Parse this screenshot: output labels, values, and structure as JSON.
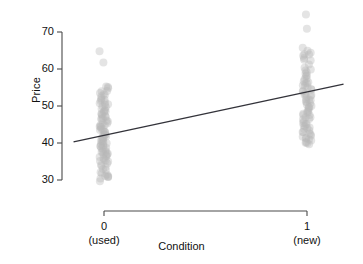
{
  "chart_data": {
    "type": "scatter",
    "title": "",
    "xlabel": "Condition",
    "ylabel": "Price",
    "xlim": [
      -0.18,
      1.18
    ],
    "ylim": [
      27,
      76
    ],
    "grid": false,
    "legend": null,
    "x_ticks": [
      {
        "value": 0,
        "label": "0",
        "sublabel": "(used)"
      },
      {
        "value": 1,
        "label": "1",
        "sublabel": "(new)"
      }
    ],
    "y_ticks": [
      30,
      40,
      50,
      60,
      70
    ],
    "point_style": {
      "color": "#b9b9b9",
      "opacity": 0.38,
      "radius": 4.0,
      "jitter_x": 0.022
    },
    "line_style": {
      "color": "#33333a",
      "width": 1.4
    },
    "fit_line": {
      "x": [
        -0.15,
        1.18
      ],
      "y": [
        40.3,
        55.9
      ],
      "intercept": 42.0,
      "slope": 13.7
    },
    "series": [
      {
        "name": "used",
        "x_value": 0,
        "values": [
          64.9,
          61.6,
          55.2,
          55.0,
          54.6,
          54.2,
          53.9,
          53.6,
          53.2,
          52.9,
          52.5,
          52.2,
          51.9,
          51.6,
          51.3,
          51.0,
          50.7,
          50.4,
          50.1,
          49.9,
          49.6,
          49.3,
          49.0,
          48.8,
          48.5,
          48.2,
          48.0,
          47.7,
          47.5,
          47.2,
          47.0,
          46.7,
          46.5,
          46.2,
          46.0,
          45.8,
          45.5,
          45.3,
          45.0,
          44.8,
          44.6,
          44.3,
          44.1,
          43.9,
          43.6,
          43.4,
          43.2,
          43.0,
          42.7,
          42.5,
          42.3,
          42.1,
          41.9,
          41.6,
          41.4,
          41.2,
          41.0,
          40.8,
          40.6,
          40.4,
          40.1,
          39.9,
          39.7,
          39.5,
          39.3,
          39.1,
          38.9,
          38.7,
          38.5,
          38.3,
          38.0,
          37.8,
          37.6,
          37.4,
          37.2,
          37.0,
          36.8,
          36.6,
          36.4,
          36.1,
          35.9,
          35.7,
          35.4,
          35.2,
          34.9,
          34.6,
          34.3,
          33.9,
          33.5,
          33.1,
          32.6,
          32.2,
          31.8,
          31.5,
          31.2,
          31.0,
          30.8,
          30.6,
          30.3,
          29.6
        ]
      },
      {
        "name": "new",
        "x_value": 1,
        "values": [
          74.8,
          70.9,
          65.8,
          65.0,
          64.5,
          64.1,
          63.8,
          63.4,
          63.1,
          62.7,
          62.2,
          61.2,
          60.5,
          60.0,
          59.6,
          59.2,
          58.8,
          58.4,
          58.0,
          57.6,
          57.2,
          56.9,
          56.5,
          56.2,
          55.9,
          55.6,
          55.3,
          55.0,
          54.7,
          54.4,
          54.1,
          53.8,
          53.5,
          53.2,
          52.9,
          52.6,
          52.3,
          52.0,
          51.8,
          51.5,
          51.2,
          50.9,
          50.6,
          50.3,
          50.0,
          49.7,
          49.4,
          49.1,
          48.8,
          48.5,
          48.2,
          47.9,
          47.6,
          47.4,
          47.1,
          46.8,
          46.5,
          46.2,
          45.9,
          45.6,
          45.3,
          45.0,
          44.8,
          44.5,
          44.2,
          43.9,
          43.7,
          43.4,
          43.1,
          42.9,
          42.6,
          42.3,
          42.0,
          41.7,
          41.5,
          41.2,
          41.0,
          40.8,
          40.5,
          40.2,
          39.9,
          39.6
        ]
      }
    ]
  }
}
